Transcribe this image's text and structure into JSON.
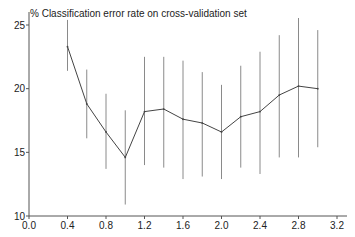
{
  "chart_data": {
    "type": "line",
    "title": "% Classification error rate on cross-validation set",
    "xlabel": "",
    "ylabel": "",
    "xlim": [
      0.0,
      3.2
    ],
    "ylim": [
      10,
      25
    ],
    "x_ticks": [
      "0.0",
      "0.4",
      "0.8",
      "1.2",
      "1.6",
      "2.0",
      "2.4",
      "2.8",
      "3.2"
    ],
    "y_ticks": [
      "10",
      "15",
      "20",
      "25"
    ],
    "grid": false,
    "legend": null,
    "series": [
      {
        "name": "cv error",
        "x": [
          0.4,
          0.6,
          0.8,
          1.0,
          1.2,
          1.4,
          1.6,
          1.8,
          2.0,
          2.2,
          2.4,
          2.6,
          2.8,
          3.0
        ],
        "values": [
          23.3,
          18.8,
          16.6,
          14.6,
          18.2,
          18.4,
          17.6,
          17.3,
          16.6,
          17.8,
          18.2,
          19.5,
          20.2,
          20.0
        ],
        "err_low": [
          21.4,
          16.1,
          13.7,
          10.9,
          14.0,
          13.8,
          12.9,
          13.1,
          12.9,
          13.8,
          13.3,
          14.6,
          14.6,
          15.4
        ],
        "err_high": [
          25.4,
          21.5,
          19.6,
          18.3,
          22.5,
          22.5,
          22.2,
          21.3,
          20.3,
          21.8,
          22.9,
          24.2,
          25.7,
          24.6
        ]
      }
    ]
  },
  "colors": {
    "line": "#444444",
    "error_bar": "#8a8a8a",
    "axis": "#555555"
  }
}
